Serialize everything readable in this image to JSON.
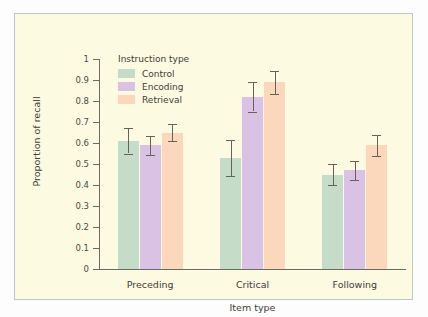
{
  "chart_data": {
    "type": "bar",
    "title": "",
    "xlabel": "Item type",
    "ylabel": "Proportion of recall",
    "ylim": [
      0,
      1
    ],
    "ytick_labels": [
      "1",
      "0.9",
      "0.8",
      "0.7",
      "0.6",
      "0.5",
      "0.4",
      "0.3",
      "0.2",
      "0.1",
      "0"
    ],
    "ytick_values": [
      1,
      0.9,
      0.8,
      0.7,
      0.6,
      0.5,
      0.4,
      0.3,
      0.2,
      0.1,
      0
    ],
    "grid": false,
    "legend_position": "upper-left-inside",
    "legend_title": "Instruction type",
    "categories": [
      "Preceding",
      "Critical",
      "Following"
    ],
    "series": [
      {
        "name": "Control",
        "color": "#c5dcc9",
        "values": [
          0.61,
          0.53,
          0.45
        ],
        "errors": [
          0.06,
          0.085,
          0.05
        ]
      },
      {
        "name": "Encoding",
        "color": "#d9c2e3",
        "values": [
          0.59,
          0.82,
          0.47
        ],
        "errors": [
          0.045,
          0.07,
          0.045
        ]
      },
      {
        "name": "Retrieval",
        "color": "#fbd8bb",
        "values": [
          0.65,
          0.89,
          0.59
        ],
        "errors": [
          0.04,
          0.055,
          0.05
        ]
      }
    ]
  },
  "figure": {
    "background_color": "#fdfae2",
    "frame_color": "#b9c6d4",
    "axis_color": "#6b6b63",
    "error_bar_color": "#63635c",
    "text_color": "#3d3d36"
  }
}
